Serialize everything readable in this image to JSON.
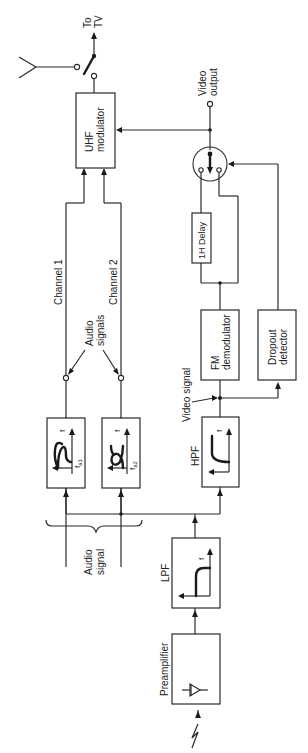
{
  "figure": {
    "type": "block-diagram",
    "orientation": "rotated-90-ccw"
  },
  "blocks": {
    "preamplifier": "Preamplifier",
    "lpf": "LPF",
    "hpf": "HPF",
    "fm_demodulator_l1": "FM",
    "fm_demodulator_l2": "demodulator",
    "dropout_detector_l1": "Dropout",
    "dropout_detector_l2": "detector",
    "delay": "1H Delay",
    "uhf_modulator_l1": "UHF",
    "uhf_modulator_l2": "modulator",
    "bpf1_freq": "f",
    "bpf1_sub": "a1",
    "bpf2_freq": "f",
    "bpf2_sub": "a2",
    "axis_f": "f"
  },
  "labels": {
    "audio_signal_l1": "Audio",
    "audio_signal_l2": "signal",
    "audio_signals_l1": "Audio",
    "audio_signals_l2": "signals",
    "channel_1": "Channel 1",
    "channel_2": "Channel 2",
    "video_signal": "Video signal",
    "video_output_l1": "Video",
    "video_output_l2": "output",
    "to_tv_l1": "To",
    "to_tv_l2": "TV"
  },
  "icons": {
    "antenna": "antenna-icon",
    "rf_switch": "switch-icon",
    "selector_switch": "dropout-switch-icon",
    "diode": "diode-icon",
    "tape_head": "tape-head-signal-icon"
  },
  "colors": {
    "line": "#2a2a2a",
    "background": "#ffffff"
  }
}
